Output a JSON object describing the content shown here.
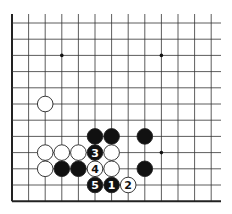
{
  "diagram": {
    "type": "go-board-fragment",
    "grid": {
      "origin_x": 12,
      "origin_y": 23,
      "col_spacing": 16.6,
      "row_spacing": 16.2,
      "cols": 13,
      "rows": 12,
      "line_extent_right": 221,
      "line_extent_top": 14,
      "left_edge_is_board_edge": true,
      "bottom_edge_is_board_edge": true
    },
    "star_points": [
      {
        "col": 3,
        "row": 2
      },
      {
        "col": 9,
        "row": 2
      },
      {
        "col": 9,
        "row": 8
      }
    ],
    "stones": [
      {
        "color": "white",
        "col": 2,
        "row": 5,
        "label": ""
      },
      {
        "color": "black",
        "col": 5,
        "row": 7,
        "label": ""
      },
      {
        "color": "black",
        "col": 6,
        "row": 7,
        "label": ""
      },
      {
        "color": "black",
        "col": 8,
        "row": 7,
        "label": ""
      },
      {
        "color": "white",
        "col": 2,
        "row": 8,
        "label": ""
      },
      {
        "color": "white",
        "col": 3,
        "row": 8,
        "label": ""
      },
      {
        "color": "white",
        "col": 4,
        "row": 8,
        "label": ""
      },
      {
        "color": "black",
        "col": 5,
        "row": 8,
        "label": "3"
      },
      {
        "color": "white",
        "col": 6,
        "row": 8,
        "label": ""
      },
      {
        "color": "white",
        "col": 2,
        "row": 9,
        "label": ""
      },
      {
        "color": "black",
        "col": 3,
        "row": 9,
        "label": ""
      },
      {
        "color": "black",
        "col": 4,
        "row": 9,
        "label": ""
      },
      {
        "color": "white",
        "col": 5,
        "row": 9,
        "label": "4"
      },
      {
        "color": "white",
        "col": 6,
        "row": 9,
        "label": ""
      },
      {
        "color": "black",
        "col": 8,
        "row": 9,
        "label": ""
      },
      {
        "color": "black",
        "col": 5,
        "row": 10,
        "label": "5"
      },
      {
        "color": "black",
        "col": 6,
        "row": 10,
        "label": "1"
      },
      {
        "color": "white",
        "col": 7,
        "row": 10,
        "label": "2"
      }
    ],
    "colors": {
      "line": "#333333",
      "edge": "#222222",
      "black_stone": "#111111",
      "white_stone": "#ffffff",
      "stone_outline": "#222222"
    }
  }
}
